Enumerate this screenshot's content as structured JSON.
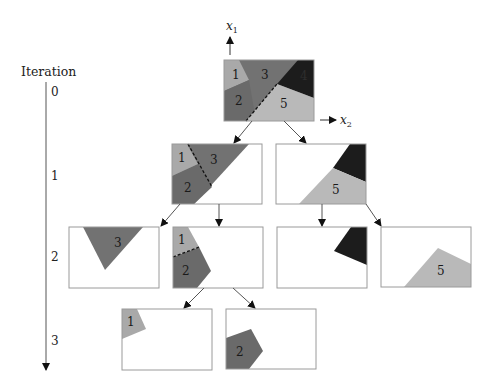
{
  "axis": {
    "title": "Iteration",
    "ticks": [
      "0",
      "1",
      "2",
      "3"
    ],
    "x1_label": "x",
    "x1_sub": "1",
    "x2_label": "x",
    "x2_sub": "2"
  },
  "colors": {
    "region_1": "#a9a9a9",
    "region_2": "#6e6e6e",
    "region_3": "#727272",
    "region_4": "#1c1c1c",
    "region_5": "#b9b9b9",
    "box_border": "#9a9a9a",
    "arrow": "#555555"
  },
  "tree": {
    "level_0": [
      {
        "id": "root",
        "regions": [
          "1",
          "2",
          "3",
          "4",
          "5"
        ]
      }
    ],
    "level_1": [
      {
        "id": "n1a",
        "regions": [
          "1",
          "2",
          "3"
        ]
      },
      {
        "id": "n1b",
        "regions": [
          "4",
          "5"
        ]
      }
    ],
    "level_2": [
      {
        "id": "n2a",
        "regions": [
          "3"
        ]
      },
      {
        "id": "n2b",
        "regions": [
          "1",
          "2"
        ]
      },
      {
        "id": "n2c",
        "regions": [
          "4"
        ]
      },
      {
        "id": "n2d",
        "regions": [
          "5"
        ]
      }
    ],
    "level_3": [
      {
        "id": "n3a",
        "regions": [
          "1"
        ]
      },
      {
        "id": "n3b",
        "regions": [
          "2"
        ]
      }
    ]
  },
  "labels": {
    "r1": "1",
    "r2": "2",
    "r3": "3",
    "r4": "4",
    "r5": "5"
  }
}
